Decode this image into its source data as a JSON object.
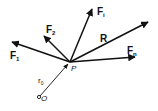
{
  "diagram": {
    "point_P": {
      "label": "P",
      "x": 70,
      "y": 62
    },
    "origin_O": {
      "label": "O",
      "x": 39,
      "y": 97
    },
    "position_vector": {
      "label": "r",
      "sub": "0"
    },
    "vectors": [
      {
        "label": "F",
        "sub": "1",
        "tip": [
          11,
          42
        ]
      },
      {
        "label": "F",
        "sub": "2",
        "tip": [
          43,
          35
        ]
      },
      {
        "label": "F",
        "sub": "i",
        "tip": [
          93,
          8
        ]
      },
      {
        "label": "R",
        "sub": "",
        "tip": [
          149,
          22
        ]
      },
      {
        "label": "F",
        "sub": "n",
        "tip": [
          136,
          57
        ]
      }
    ]
  }
}
